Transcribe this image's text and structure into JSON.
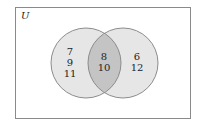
{
  "diagram": {
    "type": "venn",
    "universe_label": "U",
    "left_only": [
      "7",
      "9",
      "11"
    ],
    "intersection": [
      "8",
      "10"
    ],
    "right_only": [
      "6",
      "12"
    ],
    "colors": {
      "border": "#8a8a8a",
      "circle_fill": "#e6e6e6",
      "intersection_fill": "#c4c4c4",
      "circle_stroke": "#8c8c8c",
      "text": "#222222"
    }
  }
}
